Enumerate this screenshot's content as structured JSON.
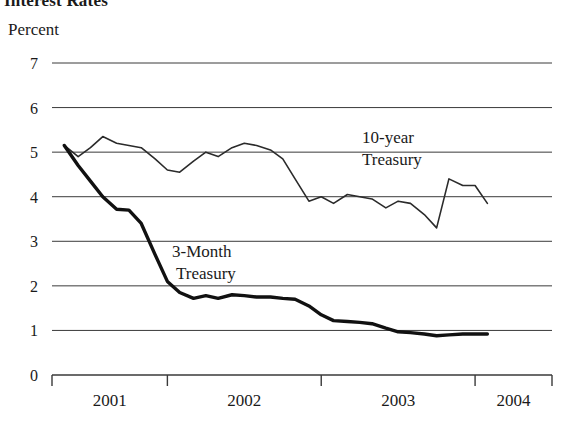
{
  "chart_title": "Interest Rates",
  "y_axis_label": "Percent",
  "annotations": {
    "ten_year_line1": "10-year",
    "ten_year_line2": "Treasury",
    "three_month_line1": "3-Month",
    "three_month_line2": "Treasury"
  },
  "chart_data": {
    "type": "line",
    "title": "Interest Rates",
    "xlabel": "",
    "ylabel": "Percent",
    "ylim": [
      0,
      7
    ],
    "xlim": [
      2000.75,
      2004.0
    ],
    "grid": true,
    "legend": "inline-annotations",
    "ytick_labels": [
      "0",
      "1",
      "2",
      "3",
      "4",
      "5",
      "6",
      "7"
    ],
    "yticks": [
      0,
      1,
      2,
      3,
      4,
      5,
      6,
      7
    ],
    "xtick_labels": [
      "2001",
      "2002",
      "2003",
      "2004"
    ],
    "xticks": [
      2001,
      2002,
      2003,
      2004
    ],
    "series": [
      {
        "name": "10-year Treasury",
        "style": "thin",
        "color": "#2b2b2b",
        "x": [
          2000.83,
          2000.92,
          2001.0,
          2001.08,
          2001.17,
          2001.25,
          2001.33,
          2001.42,
          2001.5,
          2001.58,
          2001.67,
          2001.75,
          2001.83,
          2001.92,
          2002.0,
          2002.08,
          2002.17,
          2002.25,
          2002.33,
          2002.42,
          2002.5,
          2002.58,
          2002.67,
          2002.75,
          2002.83,
          2002.92,
          2003.0,
          2003.08,
          2003.17,
          2003.25,
          2003.33,
          2003.42,
          2003.5,
          2003.58
        ],
        "values": [
          5.15,
          4.9,
          5.1,
          5.35,
          5.2,
          5.15,
          5.1,
          4.85,
          4.6,
          4.55,
          4.8,
          5.0,
          4.9,
          5.1,
          5.2,
          5.15,
          5.05,
          4.85,
          4.4,
          3.9,
          4.0,
          3.85,
          4.05,
          4.0,
          3.95,
          3.75,
          3.9,
          3.85,
          3.6,
          3.3,
          4.4,
          4.25,
          4.25,
          3.85
        ]
      },
      {
        "name": "3-Month Treasury",
        "style": "thick",
        "color": "#111111",
        "x": [
          2000.83,
          2000.92,
          2001.0,
          2001.08,
          2001.17,
          2001.25,
          2001.33,
          2001.42,
          2001.5,
          2001.58,
          2001.67,
          2001.75,
          2001.83,
          2001.92,
          2002.0,
          2002.08,
          2002.17,
          2002.25,
          2002.33,
          2002.42,
          2002.5,
          2002.58,
          2002.67,
          2002.75,
          2002.83,
          2002.92,
          2003.0,
          2003.08,
          2003.17,
          2003.25,
          2003.33,
          2003.42,
          2003.5,
          2003.58
        ],
        "values": [
          5.15,
          4.7,
          4.35,
          4.0,
          3.72,
          3.7,
          3.4,
          2.7,
          2.1,
          1.85,
          1.72,
          1.78,
          1.72,
          1.8,
          1.78,
          1.75,
          1.75,
          1.72,
          1.7,
          1.55,
          1.35,
          1.22,
          1.2,
          1.18,
          1.15,
          1.05,
          0.97,
          0.95,
          0.92,
          0.88,
          0.9,
          0.92,
          0.92,
          0.92
        ]
      }
    ]
  },
  "geometry": {
    "plot_left": 52,
    "plot_right": 552,
    "plot_top": 63,
    "plot_bottom": 375,
    "x_min": 2000.75,
    "x_max": 2004.0,
    "y_min": 0,
    "y_max": 7
  }
}
